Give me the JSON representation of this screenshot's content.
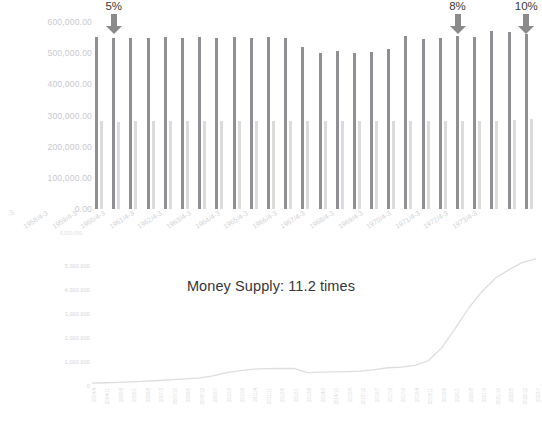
{
  "figure": {
    "background": "#ffffff",
    "colors": {
      "bar_dark": "#8f9093",
      "bar_light": "#dcdcdd",
      "arrow": "#8a8a8a",
      "axis_text": "#c9c9cf",
      "title_text": "#35353a"
    }
  },
  "annotations": [
    {
      "name": "reserve-ratio-5",
      "label": "5%",
      "bar_index": 1
    },
    {
      "name": "reserve-ratio-8",
      "label": "8%",
      "bar_index": 21
    },
    {
      "name": "reserve-ratio-10",
      "label": "10%",
      "bar_index": 25
    }
  ],
  "bar_chart": {
    "chart_data": {
      "type": "bar",
      "title": "",
      "xlabel": "",
      "ylabel": "",
      "ylim": [
        0,
        600000
      ],
      "grid": false,
      "legend": "none",
      "ytick_labels": [
        "600,000.00",
        "500,000.00",
        "400,000.00",
        "300,000.00",
        "200,000.00",
        "100,000.00",
        "0.00"
      ],
      "ytick_values": [
        600000,
        500000,
        400000,
        300000,
        200000,
        100000,
        0
      ],
      "categories": [
        "1958/4-3",
        "1959/4-3",
        "1960/4-3",
        "1961/4-3",
        "1962/4-3",
        "1963/4-3",
        "1964/4-3",
        "1965/4-3",
        "1966/4-3",
        "1967/4-3",
        "1968/4-3",
        "1969/4-3",
        "1970/4-3",
        "1971/4-3",
        "1972/4-3",
        "1973/4-3",
        "1974/4-3",
        "1975/4-3",
        "1976/4-3",
        "1977/4-3",
        "1978/4-3",
        "1979/4-3",
        "1980/4-3",
        "1981/4-3",
        "1982/4-3",
        "1983/4-3"
      ],
      "xtick_labels_shown": [
        "1958/4-3",
        "1959/4-3",
        "1960/4-3",
        "1961/4-3",
        "1962/4-3",
        "1963/4-3",
        "1964/4-3",
        "1965/4-3",
        "1966/4-3",
        "1967/4-3",
        "1968/4-3",
        "1969/4-3",
        "1970/4-3",
        "1971/4-3",
        "1972/4-3",
        "1973/4-3"
      ],
      "series": [
        {
          "name": "Total deposits",
          "color": "#8f9093",
          "values": [
            552000,
            548000,
            550000,
            549000,
            551000,
            550000,
            552000,
            549000,
            551000,
            550000,
            552000,
            549000,
            520000,
            500000,
            508000,
            500000,
            505000,
            512000,
            555000,
            545000,
            548000,
            555000,
            552000,
            570000,
            568000,
            562000
          ]
        },
        {
          "name": "Reserves / base",
          "color": "#dcdcdd",
          "values": [
            283000,
            280000,
            282000,
            281000,
            283000,
            282000,
            283000,
            281000,
            283000,
            282000,
            283000,
            281000,
            282000,
            281000,
            283000,
            282000,
            283000,
            281000,
            283000,
            282000,
            283000,
            282000,
            284000,
            281000,
            287000,
            290000
          ]
        }
      ]
    }
  },
  "line_chart": {
    "title": "Money Supply: 11.2 times",
    "chart_data": {
      "type": "line",
      "title": "Money Supply: 11.2 times",
      "xlabel": "",
      "ylabel": "",
      "ylim": [
        0,
        6000000
      ],
      "grid": false,
      "legend": "none",
      "line_color": "#dedee2",
      "ytick_labels": [
        "6,000,000",
        "5,000,000",
        "4,000,000",
        "3,000,000",
        "2,000,000",
        "1,000,000",
        "0"
      ],
      "ytick_values": [
        6000000,
        5000000,
        4000000,
        3000000,
        2000000,
        1000000,
        0
      ],
      "x": [
        "2004/4",
        "2004/11",
        "2005/6",
        "2006/1",
        "2006/8",
        "2007/3",
        "2007/10",
        "2008/5",
        "2008/12",
        "2009/7",
        "2010/2",
        "2010/9",
        "2011/4",
        "2011/11",
        "2012/6",
        "2013/1",
        "2013/8",
        "2014/3",
        "2014/10",
        "2015/5",
        "2015/12",
        "2016/7",
        "2017/2",
        "2017/9",
        "2018/4",
        "2018/11",
        "2019/6",
        "2020/1",
        "2020/8",
        "2021/3",
        "2021/10",
        "2022/5",
        "2022/12",
        "2023/7"
      ],
      "y": [
        120000,
        135000,
        150000,
        175000,
        200000,
        230000,
        265000,
        300000,
        340000,
        420000,
        560000,
        640000,
        700000,
        720000,
        730000,
        735000,
        560000,
        575000,
        590000,
        600000,
        620000,
        680000,
        760000,
        790000,
        860000,
        1050000,
        1600000,
        2400000,
        3250000,
        3950000,
        4500000,
        4850000,
        5150000,
        5300000
      ]
    }
  }
}
